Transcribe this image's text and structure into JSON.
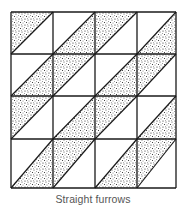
{
  "diagram": {
    "title": "Straight furrows",
    "type": "quilt-block-layout",
    "rows": 4,
    "cols": 4,
    "grid_x": [
      11,
      53,
      95,
      137,
      176
    ],
    "grid_y": [
      12,
      54,
      96,
      139,
      188
    ],
    "cell_split": "diagonal-bottom-left-to-top-right",
    "shaded_half": [
      [
        "upper-left",
        "lower-right",
        "upper-left",
        "lower-right"
      ],
      [
        "lower-right",
        "upper-left",
        "lower-right",
        "upper-left"
      ],
      [
        "upper-left",
        "lower-right",
        "upper-left",
        "lower-right"
      ],
      [
        "lower-right",
        "upper-left",
        "lower-right",
        "upper-left"
      ]
    ],
    "colors": {
      "line": "#1a1a1a",
      "shade_dots": "#222222",
      "background": "#ffffff",
      "caption": "#555555"
    }
  }
}
